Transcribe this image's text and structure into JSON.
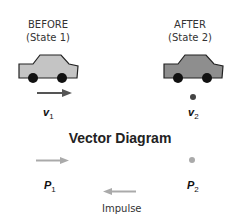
{
  "before": {
    "heading": "BEFORE",
    "state": "(State 1)",
    "velocity_label": "v",
    "velocity_sub": "1",
    "momentum_label": "P",
    "momentum_sub": "1"
  },
  "after": {
    "heading": "AFTER",
    "state": "(State 2)",
    "velocity_label": "v",
    "velocity_sub": "2",
    "momentum_label": "P",
    "momentum_sub": "2"
  },
  "vector_diagram": {
    "title": "Vector Diagram",
    "impulse_label": "Impulse"
  },
  "colors": {
    "car_before": "#c4c4c4",
    "car_after": "#8e8e8e",
    "velocity_arrow": "#555555",
    "momentum_arrow": "#aaaaaa",
    "impulse_arrow": "#aaaaaa",
    "wheel": "#111111"
  }
}
